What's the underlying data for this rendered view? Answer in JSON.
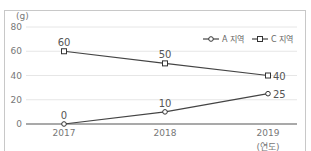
{
  "header": {
    "caption": "〈연도별 ○○ 지역 생산량 변화〉"
  },
  "chart_data": {
    "type": "line",
    "title": "",
    "xlabel": "(연도)",
    "ylabel": "(g)",
    "categories": [
      "2017",
      "2018",
      "2019"
    ],
    "yticks": [
      0,
      20,
      40,
      60,
      80
    ],
    "ylim": [
      0,
      80
    ],
    "grid": true,
    "legend_position": "top-right",
    "series": [
      {
        "name": "A 지역",
        "marker": "circle",
        "values": [
          0,
          10,
          25
        ]
      },
      {
        "name": "C 지역",
        "marker": "square",
        "values": [
          60,
          50,
          40
        ]
      }
    ]
  }
}
